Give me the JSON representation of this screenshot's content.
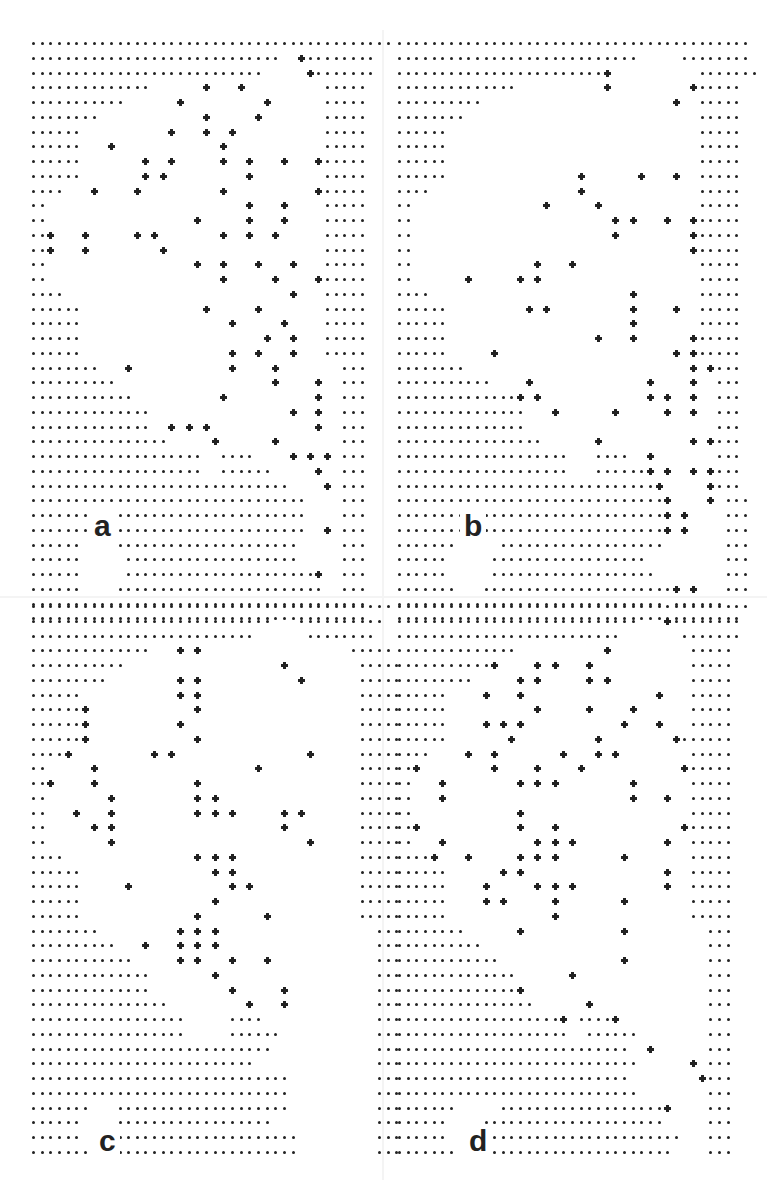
{
  "figure": {
    "grid": {
      "pitch_x": 8.65,
      "pitch_y": 14.75,
      "legend": {
        ".": "dot",
        "+": "plus-marker",
        " ": "empty"
      }
    },
    "panels": [
      {
        "id": "a",
        "label": "a",
        "origin": [
          32,
          42
        ],
        "label_pos": [
          90,
          535
        ],
        "rows": [
          "..........................................",
          ".............................  +........",
          "...........................     +.......",
          "..............      +   +         .....",
          "...........      +         +      .....",
          "........            +     +       .....",
          "......          +   +  +          .....",
          "......   +            +           .....",
          "......       +  +     +  +   +   +.....",
          "......       + +         +        .....",
          "....   +    +         +          +.....",
          "..                       +   +    .....",
          "..                 +     +   +    .....",
          "..+   +     + +       +  +  +     .....",
          "..+   +        +                  .....",
          "..                 +  +   +   +   .....",
          "..                    +     +    +.....",
          "....                          +   .....",
          "......              +     +       .....",
          "......                 +     +    .....",
          "......                     +  +   .....",
          "......                 +  +   +   .....",
          "........   +           +    +       ...",
          "..........                  +    +  ...",
          "............          +          +  ...",
          "..............                +  +  ...",
          "..............  + + +            +  ...",
          "................     +      +       ...",
          "....................  ....    + + + ...",
          "....................  ......     +  ...",
          "..............................    + ...",
          "................................    ...",
          "................................    ...",
          "................................  + ...",
          "......    .....................     ...",
          "......     ....................     ...",
          "......     ......................+  ...",
          "......    ........................  ...",
          ".......................................",
          "......................................."
        ]
      },
      {
        "id": "b",
        "label": "b",
        "origin": [
          398,
          42
        ],
        "label_pos": [
          460,
          535
        ],
        "rows": [
          ".........................................",
          "............................     ........",
          "........................+          .......",
          "..............          +         +.....",
          "..........                      +  .....",
          "........                           .....",
          "......                             .....",
          "......                             .....",
          "......                             .....",
          "......               +      +   +  .....",
          "....                 +             .....",
          "..               +     +           .....",
          "..                       + +   +  +.....",
          "..                       +        +.....",
          "..                                +.....",
          "..              +   +              .....",
          "..      +     + +                  .....",
          "....                       +       .....",
          "......         + +         +    +  .....",
          "......                     +       .....",
          "......                 +   +      +.....",
          "......     +                    + +.....",
          "........                          + +...",
          "...........    +             +    +  ...",
          "..............+ +            + +  +  ...",
          "...............   +      +     +  +  ...",
          "...............                      ...",
          ".................      +          + +...",
          "....................   ....  +       ...",
          "....................   ......+ +  + +...",
          "..............................+     +...",
          "...............................+    + ...",
          "...............................+ +    ...",
          "...............................+ +    ...",
          ".......     ...................       ...",
          "......     ..................         ...",
          "......     ...................        ...",
          ".......   ......................+ +   ...",
          "............................... ......",
          "........................................"
        ]
      },
      {
        "id": "c",
        "label": "c",
        "origin": [
          32,
          605
        ],
        "label_pos": [
          95,
          1150
        ],
        "rows": [
          "..........................................",
          "............................   ..........",
          "..........................      ........",
          "..............   + +                 .....",
          "...........                  +        .....",
          ".........        + +           +      .....",
          "......           + +                  .....",
          "......+            +                  .....",
          "......+          +                    .....",
          "......+            +                  .....",
          "....+         + +               +     .....",
          "..     +                  +           .....",
          "..+    +           +                  .....",
          "..       +         + +                .....",
          "..   +   +         + + +     + +      .....",
          "..     + +                   +        .....",
          "..       +                      +     .....",
          "....               + + +              .....",
          "......               + +              .....",
          "......     +           + +            .....",
          "......               +                .....",
          "......             +       +          .....",
          "........         + + +                  ...",
          "..........   +   + + +                  ...",
          "............     + +   +   +            ...",
          "..............       +                  ...",
          "..............         +     +          ...",
          "................         +   +          ...",
          "..................     ....             ...",
          "..................     ......           ...",
          "............................            ...",
          "..........................              ...",
          "..............................          ...",
          "..............................          ...",
          ".......   ....................          ...",
          "......    ..................            ...",
          "......    .....................         ...",
          ".......  ......................         ..."
        ]
      },
      {
        "id": "d",
        "label": "d",
        "origin": [
          398,
          605
        ],
        "label_pos": [
          465,
          1150
        ],
        "rows": [
          ".........................................",
          "............................   +........",
          "..........................       .......",
          "..............          +         .....",
          "...........+    + +   +           .....",
          ".........     + +     + +         .....",
          "......    +   +               +   .....",
          "......          +     +    +      .....",
          "......    + + +           +   +   .....",
          "......       +         +        +......",
          "....    +  +       +   + +        .....",
          "..+        +    +    +           +.....",
          "..   +        + + +        +      .....",
          "..   +                     +   +  .....",
          "..            +                   .....",
          "..+           +   +              +.....",
          "..   +          + + +          +  .....",
          "....+   +     + + +       +       .....",
          "......      + +                +  .....",
          "......    +     + + +          +  .....",
          "......    + +     +       +       .....",
          "......            +               .....",
          "........      +           +         ...",
          "..........                          ...",
          "............              +         ...",
          "..............      +               ...",
          "..............+                     ...",
          "................      +             ...",
          "...................+ ....+          ...",
          "....................  ......        ...",
          "...........................  +      ...",
          "............................      + ...",
          "...........................        +...",
          "............................        ...",
          ".......     ...................+    ...",
          "......    .....................     ...",
          "......    .......................   ...",
          ".......   ......................    ..."
        ]
      }
    ]
  }
}
